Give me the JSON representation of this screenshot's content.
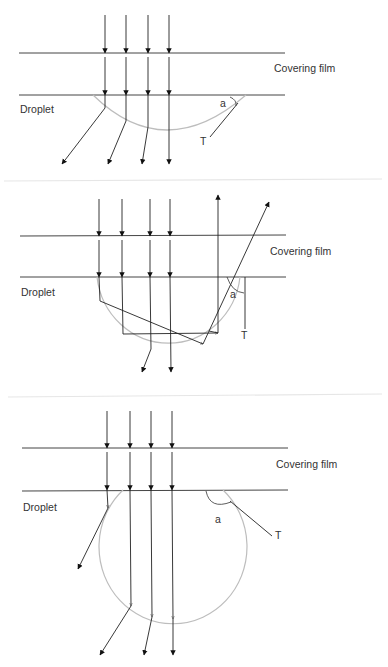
{
  "figure": {
    "panels": [
      {
        "id": "panel-1",
        "description": "Droplet with low contact angle (flat cap) - rays diverge on exit",
        "labels": {
          "film": "Covering film",
          "droplet": "Droplet",
          "angle": "a",
          "tangent": "T"
        }
      },
      {
        "id": "panel-2",
        "description": "Droplet with ~90 degree contact angle - internal reflection, some rays exit upward",
        "labels": {
          "film": "Covering film",
          "droplet": "Droplet",
          "angle": "a",
          "tangent": "T"
        }
      },
      {
        "id": "panel-3",
        "description": "Droplet with high contact angle (near-spherical) - rays refract outward",
        "labels": {
          "film": "Covering film",
          "droplet": "Droplet",
          "angle": "a",
          "tangent": "T"
        }
      }
    ]
  },
  "colors": {
    "line": "#222222",
    "droplet_outline": "#bdbdbd",
    "separator": "#e6e6e6",
    "text": "#333333"
  }
}
